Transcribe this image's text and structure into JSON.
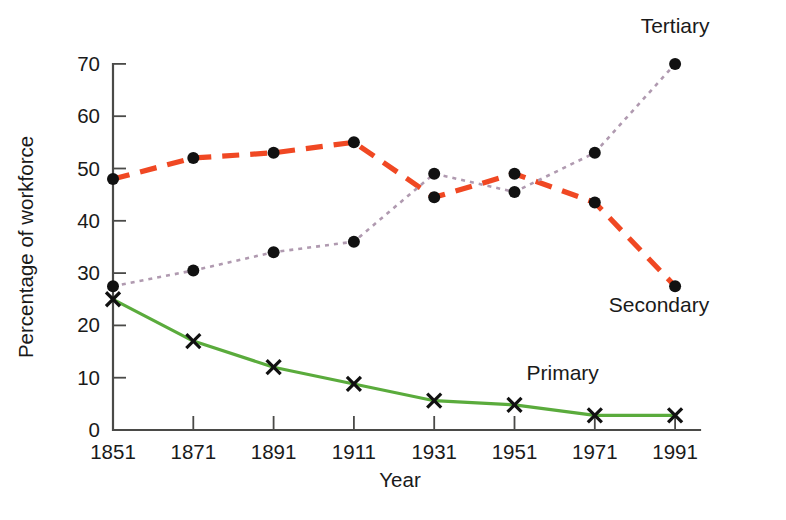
{
  "chart_data": {
    "type": "line",
    "title": "",
    "xlabel": "Year",
    "ylabel": "Percentage of workforce",
    "x": [
      1851,
      1871,
      1891,
      1911,
      1931,
      1951,
      1971,
      1991
    ],
    "x_tick_labels": [
      "1851",
      "1871",
      "1891",
      "1911",
      "1931",
      "1951",
      "1971",
      "1991"
    ],
    "y_tick_labels": [
      "0",
      "10",
      "20",
      "30",
      "40",
      "50",
      "60",
      "70"
    ],
    "y_ticks": [
      0,
      10,
      20,
      30,
      40,
      50,
      60,
      70
    ],
    "ylim": [
      0,
      70
    ],
    "xlim": [
      1851,
      1991
    ],
    "grid": false,
    "legend_position": "inline-annotations",
    "series": [
      {
        "name": "Secondary",
        "values": [
          48,
          52,
          53,
          55,
          44.5,
          49,
          43.5,
          27.5
        ],
        "color": "#f04823",
        "line_style": "dashed",
        "marker": "circle",
        "label": "Secondary",
        "label_x": 1987,
        "label_y": 22.5
      },
      {
        "name": "Tertiary",
        "values": [
          27.5,
          30.5,
          34,
          36,
          49,
          45.5,
          53,
          70
        ],
        "color": "#b09ab0",
        "line_style": "dotted",
        "marker": "circle",
        "label": "Tertiary",
        "label_x": 1991,
        "label_y": 76,
        "label_anchor": "middle"
      },
      {
        "name": "Primary",
        "values": [
          25,
          17,
          12,
          8.8,
          5.6,
          4.8,
          2.8,
          2.8
        ],
        "color": "#5aab3c",
        "line_style": "solid",
        "marker": "cross",
        "label": "Primary",
        "label_x": 1963,
        "label_y": 9.5
      }
    ]
  },
  "axis": {
    "x_title": "Year",
    "y_title": "Percentage of workforce"
  },
  "colors": {
    "secondary": "#f04823",
    "tertiary": "#b09ab0",
    "primary": "#5aab3c",
    "axis": "#4a4a48",
    "text": "#1a1a1a"
  }
}
